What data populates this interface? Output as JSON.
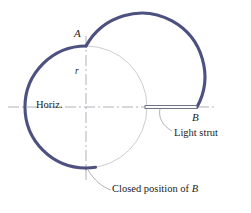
{
  "figure": {
    "colors": {
      "arc_primary": "#4d5180",
      "arc_primary_dark": "#3f4370",
      "construction_line": "#8f8f9c",
      "phantom_arc": "#b9b9c4",
      "strut_outline": "#55596e",
      "text": "#1c1c20",
      "leader": "#8f8f9c"
    },
    "labels": {
      "point_a": "A",
      "point_b": "B",
      "radius": "r",
      "horizontal": "Horiz.",
      "light_strut": "Light strut",
      "closed_position_prefix": "Closed position of ",
      "closed_position_point": "B"
    },
    "geometry": {
      "main_circle": {
        "cx": 86,
        "cy": 107,
        "r": 61
      },
      "upper_arc": {
        "cx": 145,
        "cy": 48,
        "r": 59
      },
      "point_a": {
        "x": 86,
        "y": 46
      },
      "point_b": {
        "x": 197,
        "y": 107
      },
      "strut": {
        "x1": 145,
        "y1": 107,
        "x2": 197,
        "y2": 107
      },
      "horizontal_axis_y": 107,
      "vertical_axis_x": 86,
      "closed_position_marker": {
        "x": 86,
        "y": 168
      }
    }
  }
}
